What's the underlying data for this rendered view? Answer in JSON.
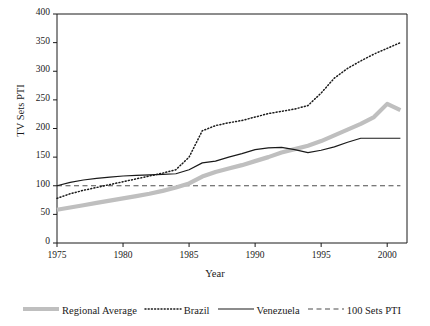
{
  "chart_data": {
    "type": "line",
    "title": "",
    "xlabel": "Year",
    "ylabel": "TV Sets PTI",
    "xlim": [
      1975,
      2001.5
    ],
    "ylim": [
      0,
      400
    ],
    "ytick_values": [
      0,
      50,
      100,
      150,
      200,
      250,
      300,
      350,
      400
    ],
    "ytick_labels": [
      "0",
      "50",
      "100",
      "150",
      "200",
      "250",
      "300",
      "350",
      "400"
    ],
    "xtick_values": [
      1975,
      1980,
      1985,
      1990,
      1995,
      2000
    ],
    "xtick_labels": [
      "1975",
      "1980",
      "1985",
      "1990",
      "1995",
      "2000"
    ],
    "grid": false,
    "legend_position": "below",
    "x": [
      1975,
      1976,
      1977,
      1978,
      1979,
      1980,
      1981,
      1982,
      1983,
      1984,
      1985,
      1986,
      1987,
      1988,
      1989,
      1990,
      1991,
      1992,
      1993,
      1994,
      1995,
      1996,
      1997,
      1998,
      1999,
      2000,
      2001
    ],
    "series": [
      {
        "name": "Regional Average",
        "style": "solid-thick-gray",
        "color": "#bfbfbf",
        "values": [
          58,
          62,
          66,
          70,
          74,
          78,
          82,
          86,
          91,
          97,
          104,
          116,
          124,
          130,
          136,
          143,
          150,
          158,
          164,
          170,
          178,
          188,
          198,
          208,
          220,
          243,
          232
        ]
      },
      {
        "name": "Brazil",
        "style": "dotted",
        "color": "#1a1a1a",
        "values": [
          78,
          86,
          92,
          97,
          102,
          107,
          112,
          117,
          122,
          128,
          150,
          196,
          205,
          210,
          214,
          220,
          226,
          230,
          234,
          240,
          262,
          288,
          305,
          318,
          330,
          340,
          350
        ]
      },
      {
        "name": "Venezuela",
        "style": "solid-thin",
        "color": "#1a1a1a",
        "values": [
          100,
          106,
          110,
          113,
          115,
          117,
          118,
          119,
          120,
          121,
          128,
          140,
          143,
          150,
          156,
          163,
          166,
          167,
          163,
          158,
          162,
          168,
          176,
          183,
          183,
          183,
          183
        ]
      },
      {
        "name": "100 Sets PTI",
        "style": "dashed",
        "color": "#4d4d4d",
        "values": [
          100,
          100,
          100,
          100,
          100,
          100,
          100,
          100,
          100,
          100,
          100,
          100,
          100,
          100,
          100,
          100,
          100,
          100,
          100,
          100,
          100,
          100,
          100,
          100,
          100,
          100,
          100
        ]
      }
    ]
  },
  "legend": {
    "items": [
      {
        "label": "Regional Average",
        "swatch": "solid-thick-gray"
      },
      {
        "label": "Brazil",
        "swatch": "dotted"
      },
      {
        "label": "Venezuela",
        "swatch": "solid-thin"
      },
      {
        "label": "100 Sets PTI",
        "swatch": "dashed"
      }
    ]
  },
  "colors": {
    "axis": "#1a1a1a",
    "regional_average": "#bfbfbf",
    "brazil": "#1a1a1a",
    "venezuela": "#1a1a1a",
    "reference_line": "#4d4d4d",
    "background": "#ffffff"
  }
}
